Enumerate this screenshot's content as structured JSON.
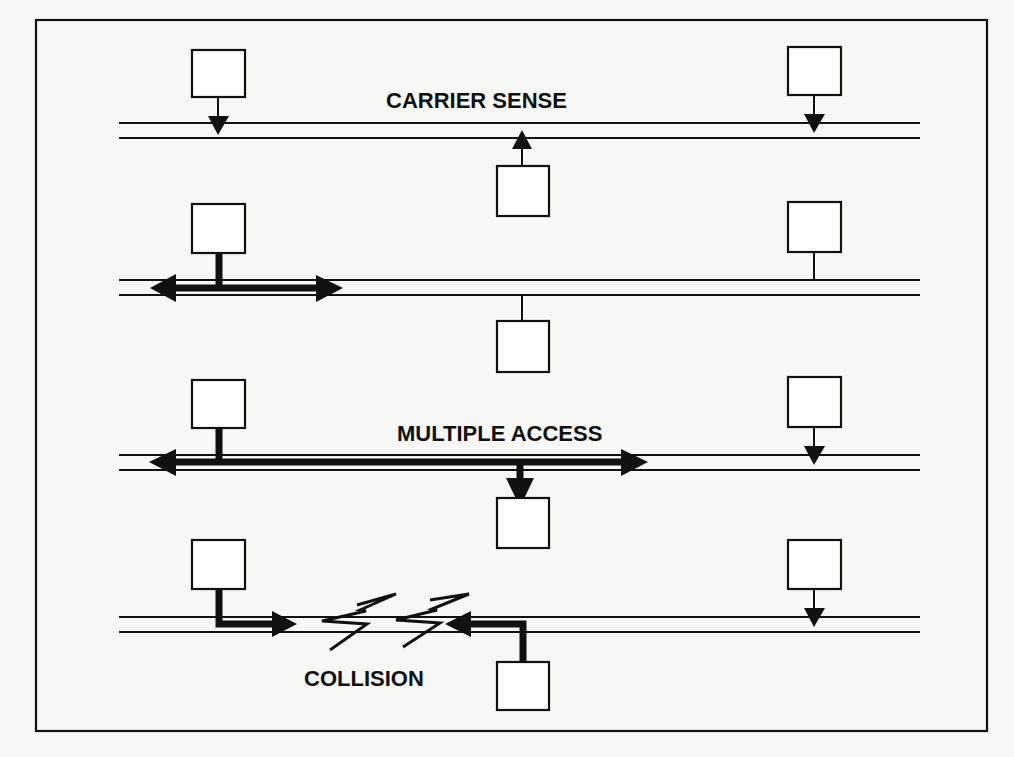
{
  "figure": {
    "background": "#f7f7f5",
    "ink": "#111111"
  },
  "panels": [
    {
      "id": "carrier-sense",
      "label": "CARRIER SENSE"
    },
    {
      "id": "transmit",
      "label": ""
    },
    {
      "id": "multiple-access",
      "label": "MULTIPLE ACCESS"
    },
    {
      "id": "collision",
      "label": "COLLISION"
    }
  ],
  "labels": {
    "carrier_sense": "CARRIER SENSE",
    "multiple_access": "MULTIPLE ACCESS",
    "collision": "COLLISION"
  },
  "nodes_per_panel": 3,
  "node_positions": [
    "left-above",
    "middle-below",
    "right-above"
  ]
}
